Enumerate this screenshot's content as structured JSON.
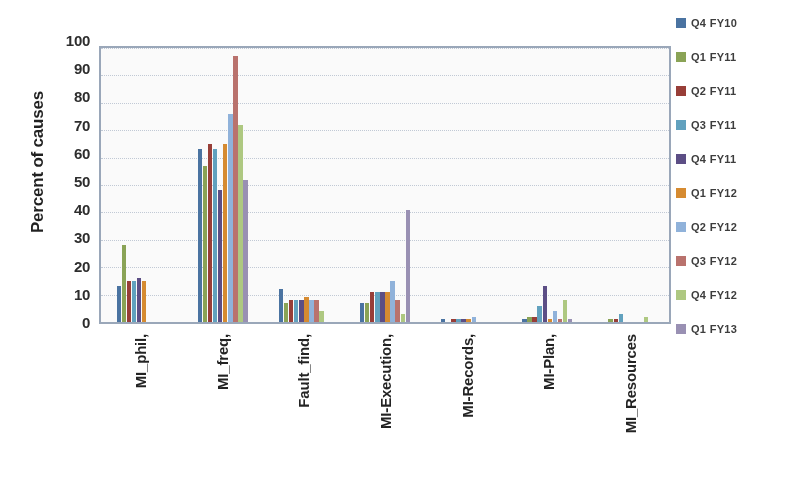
{
  "chart": {
    "ylabel": "Percent of causes",
    "y_ticks": [
      "100",
      "90",
      "80",
      "70",
      "60",
      "50",
      "40",
      "30",
      "20",
      "10",
      "0"
    ]
  },
  "legend": {
    "items": [
      {
        "label": "Q4 FY10",
        "color": "#4573a7"
      },
      {
        "label": "Q1 FY11",
        "color": "#89a54e"
      },
      {
        "label": "Q2 FY11",
        "color": "#a03a33"
      },
      {
        "label": "Q3 FY11",
        "color": "#5ba3c4"
      },
      {
        "label": "Q4 FY11",
        "color": "#5b4b8a"
      },
      {
        "label": "Q1 FY12",
        "color": "#e08b25"
      },
      {
        "label": "Q2 FY12",
        "color": "#8eb4e2"
      },
      {
        "label": "Q3 FY12",
        "color": "#c0706a"
      },
      {
        "label": "Q4 FY12",
        "color": "#aecc7c"
      },
      {
        "label": "Q1 FY13",
        "color": "#9a90b8"
      }
    ]
  },
  "chart_data": {
    "type": "bar",
    "title": "",
    "xlabel": "",
    "ylabel": "Percent of causes",
    "ylim": [
      0,
      100
    ],
    "ytick_step": 10,
    "grid": true,
    "legend_position": "right",
    "categories": [
      "MI_phil,",
      "MI_freq,",
      "Fault_find,",
      "MI-Execution,",
      "MI-Records,",
      "MI-Plan,",
      "MI_Resources"
    ],
    "series": [
      {
        "name": "Q4 FY10",
        "color": "#4573a7",
        "values": [
          13,
          63,
          12,
          7,
          1,
          1,
          0
        ]
      },
      {
        "name": "Q1 FY11",
        "color": "#89a54e",
        "values": [
          28,
          57,
          7,
          7,
          0,
          2,
          1
        ]
      },
      {
        "name": "Q2 FY11",
        "color": "#a03a33",
        "values": [
          15,
          65,
          8,
          11,
          1,
          2,
          1
        ]
      },
      {
        "name": "Q3 FY11",
        "color": "#5ba3c4",
        "values": [
          15,
          63,
          8,
          11,
          1,
          6,
          3
        ]
      },
      {
        "name": "Q4 FY11",
        "color": "#5b4b8a",
        "values": [
          16,
          48,
          8,
          11,
          1,
          13,
          0
        ]
      },
      {
        "name": "Q1 FY12",
        "color": "#e08b25",
        "values": [
          15,
          65,
          9,
          11,
          1,
          1,
          0
        ]
      },
      {
        "name": "Q2 FY12",
        "color": "#8eb4e2",
        "values": [
          0,
          76,
          8,
          15,
          2,
          4,
          0
        ]
      },
      {
        "name": "Q3 FY12",
        "color": "#c0706a",
        "values": [
          0,
          97,
          8,
          8,
          0,
          1,
          0
        ]
      },
      {
        "name": "Q4 FY12",
        "color": "#aecc7c",
        "values": [
          0,
          72,
          4,
          3,
          0,
          8,
          2
        ]
      },
      {
        "name": "Q1 FY13",
        "color": "#9a90b8",
        "values": [
          0,
          52,
          0,
          41,
          0,
          1,
          0
        ]
      }
    ]
  }
}
